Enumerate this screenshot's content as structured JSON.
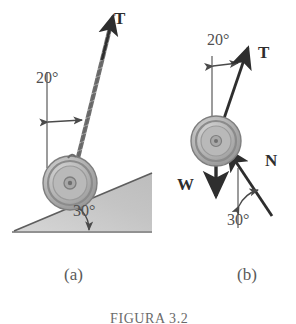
{
  "figure": {
    "caption": "FIGURA 3.2",
    "panels": [
      {
        "key": "a",
        "label": "(a)",
        "description": "wheel resting on a 30 degree incline pulled by a cord at 20 degrees from vertical"
      },
      {
        "key": "b",
        "label": "(b)",
        "description": "free body diagram of the wheel showing T, W and N"
      }
    ]
  },
  "panel_a": {
    "tension_label": "T",
    "angle_cord": "20°",
    "angle_incline": "30°"
  },
  "panel_b": {
    "tension_label": "T",
    "weight_label": "W",
    "normal_label": "N",
    "angle_tension": "20°",
    "angle_normal": "30°"
  },
  "colors": {
    "ink": "#3a3a3a",
    "vector": "#2e2e2e",
    "incline_fill": "#c9c9c9",
    "wheel_rim": "#8f8f8f",
    "wheel_face": "#b5b5b5",
    "paper": "#ffffff"
  }
}
